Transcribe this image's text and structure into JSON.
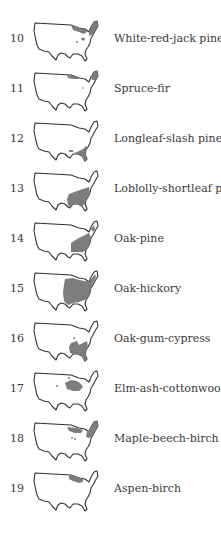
{
  "figure": {
    "colors": {
      "outline": "#333333",
      "shading": "#7d7d7d",
      "background": "#ffffff"
    },
    "items": [
      {
        "number": "10",
        "label": "White-red-jack pine",
        "region": "northern-lakes-and-northeast"
      },
      {
        "number": "11",
        "label": "Spruce-fir",
        "region": "northern-border-and-maine"
      },
      {
        "number": "12",
        "label": "Longleaf-slash pine",
        "region": "southeast-coastal-plain"
      },
      {
        "number": "13",
        "label": "Loblolly-shortleaf pine",
        "region": "south"
      },
      {
        "number": "14",
        "label": "Oak-pine",
        "region": "southeast-and-mid-atlantic"
      },
      {
        "number": "15",
        "label": "Oak-hickory",
        "region": "central-and-east"
      },
      {
        "number": "16",
        "label": "Oak-gum-cypress",
        "region": "lower-mississippi-and-southeast"
      },
      {
        "number": "17",
        "label": "Elm-ash-cottonwood",
        "region": "great-plains-and-midwest"
      },
      {
        "number": "18",
        "label": "Maple-beech-birch",
        "region": "northeast-and-lakes"
      },
      {
        "number": "19",
        "label": "Aspen-birch",
        "region": "upper-midwest"
      }
    ]
  }
}
